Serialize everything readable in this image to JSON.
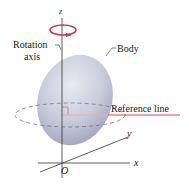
{
  "diagram": {
    "labels": {
      "z_axis": "z",
      "x_axis": "x",
      "y_axis": "y",
      "origin": "O",
      "rotation_axis_line1": "Rotation",
      "rotation_axis_line2": "axis",
      "body": "Body",
      "reference_line": "Reference line"
    },
    "colors": {
      "body_fill": "#c4c6d8",
      "body_shadow": "#9fa2bc",
      "rotation_arrow": "#c0404a",
      "reference_line": "#d0303a",
      "axes": "#333333",
      "dashed_circle": "#777777"
    }
  }
}
